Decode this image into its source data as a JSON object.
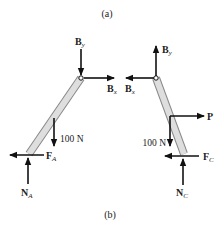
{
  "figure": {
    "caption_top": "(a)",
    "caption_bottom": "(b)",
    "colors": {
      "ink": "#111111",
      "member_fill": "#d9d9d9",
      "member_stroke": "#888888"
    }
  },
  "left_fbd": {
    "member": "AB",
    "forces": [
      {
        "name": "B",
        "sub": "y",
        "direction": "down",
        "at": "B"
      },
      {
        "name": "B",
        "sub": "x",
        "direction": "right",
        "at": "B"
      },
      {
        "name": "100 N",
        "direction": "down",
        "at": "midspan"
      },
      {
        "name": "F",
        "sub": "A",
        "direction": "left",
        "at": "A"
      },
      {
        "name": "N",
        "sub": "A",
        "direction": "up",
        "at": "A"
      }
    ],
    "labels": {
      "By_main": "B",
      "By_sub": "y",
      "Bx_main": "B",
      "Bx_sub": "x",
      "load": "100 N",
      "FA_main": "F",
      "FA_sub": "A",
      "NA_main": "N",
      "NA_sub": "A"
    }
  },
  "right_fbd": {
    "member": "BC",
    "forces": [
      {
        "name": "B",
        "sub": "y",
        "direction": "up",
        "at": "B"
      },
      {
        "name": "B",
        "sub": "x",
        "direction": "left",
        "at": "B"
      },
      {
        "name": "P",
        "direction": "right",
        "at": "midspan"
      },
      {
        "name": "100 N",
        "direction": "down",
        "at": "midspan"
      },
      {
        "name": "F",
        "sub": "C",
        "direction": "left",
        "at": "C"
      },
      {
        "name": "N",
        "sub": "C",
        "direction": "up",
        "at": "C"
      }
    ],
    "labels": {
      "By_main": "B",
      "By_sub": "y",
      "Bx_main": "B",
      "Bx_sub": "x",
      "P": "P",
      "load": "100 N",
      "FC_main": "F",
      "FC_sub": "C",
      "NC_main": "N",
      "NC_sub": "C"
    }
  }
}
